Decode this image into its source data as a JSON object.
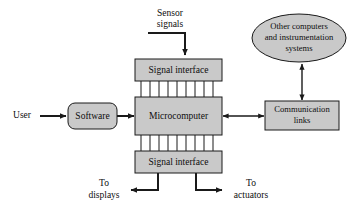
{
  "diagram": {
    "colors": {
      "node_fill": "#c9c9c9",
      "stroke": "#1a1a1a",
      "background": "#ffffff"
    },
    "nodes": {
      "sensor_signals": {
        "line1": "Sensor",
        "line2": "signals"
      },
      "signal_interface_top": {
        "label": "Signal interface"
      },
      "microcomputer": {
        "label": "Microcomputer"
      },
      "signal_interface_bottom": {
        "label": "Signal interface"
      },
      "software": {
        "label": "Software"
      },
      "user": {
        "label": "User"
      },
      "communication_links": {
        "line1": "Communication",
        "line2": "links"
      },
      "other_computers": {
        "line1": "Other computers",
        "line2": "and instrumentation",
        "line3": "systems"
      },
      "to_displays": {
        "line1": "To",
        "line2": "displays"
      },
      "to_actuators": {
        "line1": "To",
        "line2": "actuators"
      }
    },
    "bus": {
      "top_line_count": 10,
      "bottom_line_count": 10
    }
  }
}
